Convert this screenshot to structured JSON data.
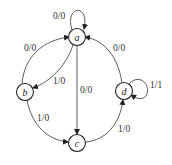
{
  "diagram": {
    "type": "state-machine",
    "nodes": [
      {
        "id": "a",
        "label": "a"
      },
      {
        "id": "b",
        "label": "b"
      },
      {
        "id": "c",
        "label": "c"
      },
      {
        "id": "d",
        "label": "d"
      }
    ],
    "edges": [
      {
        "from": "a",
        "to": "a",
        "label": "0/0"
      },
      {
        "from": "b",
        "to": "a",
        "label": "0/0"
      },
      {
        "from": "a",
        "to": "b",
        "label": "1/0"
      },
      {
        "from": "a",
        "to": "c",
        "label": "0/0"
      },
      {
        "from": "d",
        "to": "a",
        "label": "0/0"
      },
      {
        "from": "d",
        "to": "d",
        "label": "1/1"
      },
      {
        "from": "b",
        "to": "c",
        "label": "1/0"
      },
      {
        "from": "c",
        "to": "d",
        "label": "1/0"
      }
    ]
  }
}
